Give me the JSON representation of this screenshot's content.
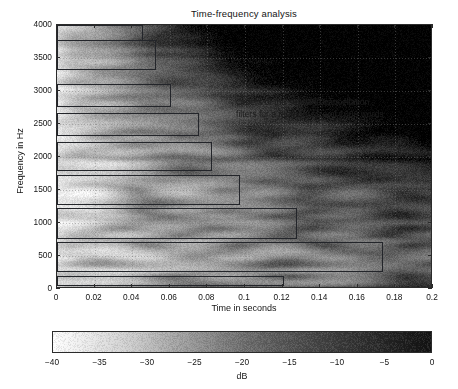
{
  "figure": {
    "title": "Time-frequency analysis",
    "annotation_line1": "Orders of the subband cancellation",
    "annotation_line2": "filters for a memory size of 1000 words",
    "xlabel": "Time in seconds",
    "ylabel": "Frequency in Hz",
    "colorbar_label": "dB"
  },
  "chart_data": {
    "type": "heatmap",
    "title": "Time-frequency analysis",
    "xlabel": "Time in seconds",
    "ylabel": "Frequency in Hz",
    "xlim": [
      0,
      0.2
    ],
    "ylim": [
      0,
      4000
    ],
    "xticks": [
      0,
      0.02,
      0.04,
      0.06,
      0.08,
      0.1,
      0.12,
      0.14,
      0.16,
      0.18,
      0.2
    ],
    "xticklabels": [
      "0",
      "0.02",
      "0.04",
      "0.06",
      "0.08",
      "0.1",
      "0.12",
      "0.14",
      "0.16",
      "0.18",
      "0.2"
    ],
    "yticks": [
      0,
      500,
      1000,
      1500,
      2000,
      2500,
      3000,
      3500,
      4000
    ],
    "yticklabels": [
      "0",
      "500",
      "1000",
      "1500",
      "2000",
      "2500",
      "3000",
      "3500",
      "4000"
    ],
    "grid": true,
    "colormap": "gray-inverted",
    "colorbar": {
      "min": -40,
      "max": 0,
      "unit": "dB",
      "label": "dB",
      "ticks": [
        -40,
        -35,
        -30,
        -25,
        -20,
        -15,
        -10,
        -5,
        0
      ],
      "ticklabels": [
        "-40",
        "-35",
        "-30",
        "-25",
        "-20",
        "-15",
        "-10",
        "-5",
        "0"
      ],
      "orientation": "horizontal"
    },
    "annotation": {
      "text": "Orders of the subband cancellation filters for a memory size of 1000 words",
      "x": 0.096,
      "y": 2800
    },
    "overlay_rectangles": [
      {
        "index": 1,
        "f_low": 3778,
        "f_high": 4000,
        "t_start": 0.0,
        "t_end": 0.045
      },
      {
        "index": 2,
        "f_low": 3333,
        "f_high": 3778,
        "t_start": 0.0,
        "t_end": 0.052
      },
      {
        "index": 3,
        "f_low": 2778,
        "f_high": 3111,
        "t_start": 0.0,
        "t_end": 0.06
      },
      {
        "index": 4,
        "f_low": 2333,
        "f_high": 2667,
        "t_start": 0.0,
        "t_end": 0.075
      },
      {
        "index": 5,
        "f_low": 1800,
        "f_high": 2222,
        "t_start": 0.0,
        "t_end": 0.082
      },
      {
        "index": 6,
        "f_low": 1289,
        "f_high": 1733,
        "t_start": 0.0,
        "t_end": 0.097
      },
      {
        "index": 7,
        "f_low": 778,
        "f_high": 1222,
        "t_start": 0.0,
        "t_end": 0.127
      },
      {
        "index": 8,
        "f_low": 267,
        "f_high": 711,
        "t_start": 0.0,
        "t_end": 0.173
      },
      {
        "index": 9,
        "f_low": 67,
        "f_high": 200,
        "t_start": 0.0,
        "t_end": 0.12
      }
    ]
  }
}
